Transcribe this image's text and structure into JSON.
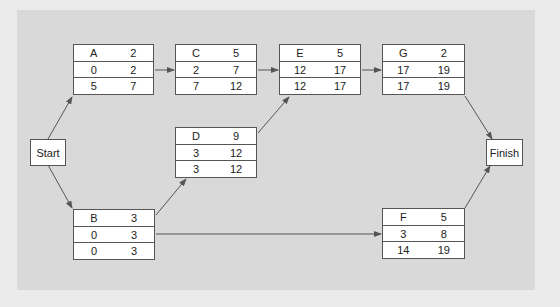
{
  "diagram": {
    "type": "activity-on-node network (critical path)",
    "colors": {
      "background": "#d9d9d9",
      "outer": "#ebebeb",
      "node_fill": "#ffffff",
      "line": "#555555"
    },
    "start": {
      "label": "Start"
    },
    "finish": {
      "label": "Finish"
    },
    "nodes": {
      "A": {
        "name": "A",
        "duration": "2",
        "es": "0",
        "ef": "2",
        "ls": "5",
        "lf": "7"
      },
      "B": {
        "name": "B",
        "duration": "3",
        "es": "0",
        "ef": "3",
        "ls": "0",
        "lf": "3"
      },
      "C": {
        "name": "C",
        "duration": "5",
        "es": "2",
        "ef": "7",
        "ls": "7",
        "lf": "12"
      },
      "D": {
        "name": "D",
        "duration": "9",
        "es": "3",
        "ef": "12",
        "ls": "3",
        "lf": "12"
      },
      "E": {
        "name": "E",
        "duration": "5",
        "es": "12",
        "ef": "17",
        "ls": "12",
        "lf": "17"
      },
      "F": {
        "name": "F",
        "duration": "5",
        "es": "3",
        "ef": "8",
        "ls": "14",
        "lf": "19"
      },
      "G": {
        "name": "G",
        "duration": "2",
        "es": "17",
        "ef": "19",
        "ls": "17",
        "lf": "19"
      }
    },
    "edges": [
      [
        "Start",
        "A"
      ],
      [
        "Start",
        "B"
      ],
      [
        "A",
        "C"
      ],
      [
        "C",
        "E"
      ],
      [
        "B",
        "D"
      ],
      [
        "D",
        "E"
      ],
      [
        "E",
        "G"
      ],
      [
        "B",
        "F"
      ],
      [
        "G",
        "Finish"
      ],
      [
        "F",
        "Finish"
      ]
    ]
  }
}
